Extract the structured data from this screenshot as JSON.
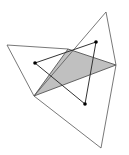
{
  "diagram": {
    "width": 129,
    "height": 155,
    "colors": {
      "background": "#ffffff",
      "outer_stroke": "#555555",
      "inner_stroke": "#333333",
      "fill": "#c0c0c0",
      "point": "#000000"
    },
    "shaded_triangle": {
      "points": [
        [
          34,
          96
        ],
        [
          68,
          49
        ],
        [
          116,
          65
        ]
      ]
    },
    "outer_polygon": {
      "points": [
        [
          7,
          45
        ],
        [
          68,
          49
        ],
        [
          106,
          12
        ],
        [
          116,
          65
        ],
        [
          101,
          148
        ],
        [
          34,
          96
        ]
      ]
    },
    "outer_lines": [
      {
        "from": [
          7,
          45
        ],
        "to": [
          68,
          49
        ]
      },
      {
        "from": [
          106,
          12
        ],
        "to": [
          34,
          96
        ]
      },
      {
        "from": [
          106,
          12
        ],
        "to": [
          116,
          65
        ]
      },
      {
        "from": [
          116,
          65
        ],
        "to": [
          101,
          148
        ]
      },
      {
        "from": [
          101,
          148
        ],
        "to": [
          34,
          96
        ]
      },
      {
        "from": [
          34,
          96
        ],
        "to": [
          7,
          45
        ]
      }
    ],
    "inner_triangle": {
      "points": [
        [
          35,
          63
        ],
        [
          96,
          42
        ],
        [
          85,
          104
        ]
      ]
    },
    "points": [
      {
        "name": "left-dot",
        "x": 35,
        "y": 63
      },
      {
        "name": "top-right-dot",
        "x": 96,
        "y": 42
      },
      {
        "name": "bottom-dot",
        "x": 85,
        "y": 104
      }
    ]
  }
}
